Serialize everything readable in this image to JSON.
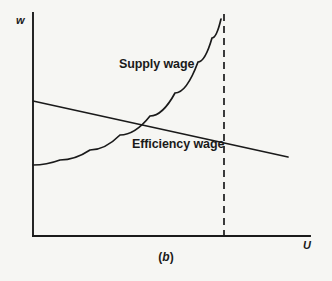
{
  "figure": {
    "caption": "(b)",
    "caption_prefix": "(",
    "caption_letter": "b",
    "caption_suffix": ")",
    "background_color": "#f6f6f3",
    "ink_color": "#1a1a1a"
  },
  "axes": {
    "y_label": "w",
    "x_label": "U",
    "y_axis": {
      "x": 33,
      "y_top": 13,
      "y_bottom": 236
    },
    "x_axis": {
      "y": 236,
      "x_left": 33,
      "x_right": 310
    }
  },
  "labels": {
    "supply_wage": "Supply wage",
    "efficiency_wage": "Efficiency wage"
  },
  "chart_data": {
    "type": "line",
    "title": "(b)",
    "xlabel": "U",
    "ylabel": "w",
    "grid": false,
    "legend": "inline-annotations",
    "xlim": [
      0,
      1
    ],
    "ylim": [
      0,
      1
    ],
    "annotations": [
      {
        "text": "Supply wage",
        "x": 119,
        "y": 65
      },
      {
        "text": "Efficiency wage",
        "x": 132,
        "y": 145
      },
      {
        "text": "(b)",
        "x": 166,
        "y": 258
      }
    ],
    "series": [
      {
        "name": "Supply wage",
        "style": "solid",
        "shape": "convex-increasing",
        "points": [
          {
            "x": 33,
            "y": 165
          },
          {
            "x": 60,
            "y": 160
          },
          {
            "x": 90,
            "y": 150
          },
          {
            "x": 120,
            "y": 135
          },
          {
            "x": 150,
            "y": 116
          },
          {
            "x": 175,
            "y": 93
          },
          {
            "x": 198,
            "y": 62
          },
          {
            "x": 212,
            "y": 38
          },
          {
            "x": 221,
            "y": 19
          }
        ]
      },
      {
        "name": "Efficiency wage",
        "style": "solid",
        "shape": "linear-decreasing",
        "points": [
          {
            "x": 33,
            "y": 101
          },
          {
            "x": 288,
            "y": 157
          }
        ]
      },
      {
        "name": "Full employment boundary",
        "style": "dashed",
        "shape": "vertical",
        "points": [
          {
            "x": 224,
            "y": 14
          },
          {
            "x": 224,
            "y": 236
          }
        ]
      }
    ],
    "intersection": {
      "x": 136,
      "y": 126,
      "note": "Supply wage crosses Efficiency wage"
    }
  }
}
